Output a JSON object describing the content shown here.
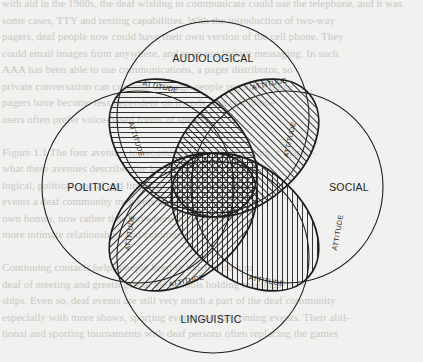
{
  "figure": {
    "type": "four-circle venn diagram",
    "circles": [
      {
        "id": "audiological",
        "label": "AUDIOLOGICAL",
        "position": "top"
      },
      {
        "id": "political",
        "label": "POLITICAL",
        "position": "left"
      },
      {
        "id": "social",
        "label": "SOCIAL",
        "position": "right"
      },
      {
        "id": "linguistic",
        "label": "LINGUISTIC",
        "position": "bottom"
      }
    ],
    "lenses": [
      {
        "id": "upper-left",
        "hatch": "horizontal",
        "labels": [
          "ATTITUDE",
          "ATTITUDE"
        ]
      },
      {
        "id": "upper-right",
        "hatch": "diagonal-backslash",
        "labels": [
          "ATTITUDE",
          "ATTITUDE"
        ]
      },
      {
        "id": "lower-left",
        "hatch": "diagonal-slash",
        "labels": [
          "ATTITUDE",
          "ATTITUDE"
        ]
      },
      {
        "id": "lower-right",
        "hatch": "vertical",
        "labels": [
          "ATTITUDE",
          "ATTITUDE"
        ]
      }
    ],
    "center": {
      "hatch": "cross-hatch"
    },
    "attitude_label": "ATTITUDE"
  },
  "colors": {
    "ink": "#1e1e1e",
    "paper": "#f1f1ef",
    "bleed_text": "#c9c9c6"
  },
  "bleed_lines": [
    "with aid in the 1960s, the deaf wishing to communicate could use the telephone, and it was",
    "some cases, TTY and texting capabilities. With the introduction of two-way",
    "pagers, deaf people now could have their own version of the cell phone. They",
    "could email images from anywhere, and even use instant messaging. In such",
    "AAA has been able to use communications, a pager distributor, so",
    "private conversation can continue although people requiring these",
    "pagers have become less dependent on friends. But cell phone",
    "users often prefer voice-based forms of speech.",
    "",
    "Figure 1.1 The four avenues to becoming deaf—the meaning, c math—",
    "what these avenues describes the lack of illit these technol-",
    "logical, political, social and linguistic kind of clubs and",
    "events a deaf community members in their",
    "own homes, now rather than anywhere it make easier",
    "more intimate relationships and community.",
    "",
    "Continuing contacts helps people keep in touch with him",
    "deaf of meeting and greeting as at the schools holding meetings",
    "ships. Even so, deaf events are still very much a part of the deaf community",
    "especially with more shows, sporting events and the coming events. Their abil-",
    "tional and sporting tournaments with deaf persons often replacing the games",
    "",
    "With technology being both a burden and an asset to the deaf community,"
  ]
}
